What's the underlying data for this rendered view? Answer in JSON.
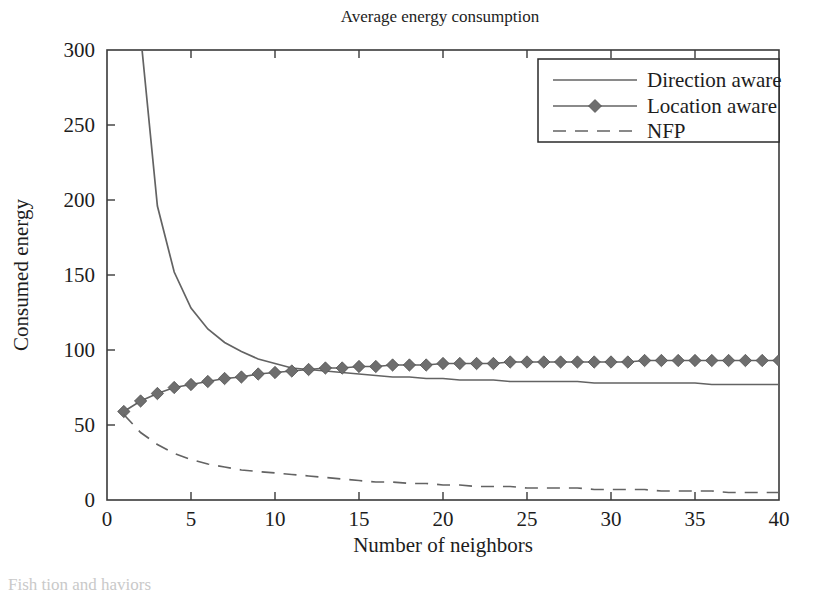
{
  "chart_data": {
    "type": "line",
    "title": "Average energy consumption",
    "xlabel": "Number of neighbors",
    "ylabel": "Consumed energy",
    "xlim": [
      0,
      40
    ],
    "ylim": [
      0,
      300
    ],
    "xticks": [
      0,
      5,
      10,
      15,
      20,
      25,
      30,
      35,
      40
    ],
    "yticks": [
      0,
      50,
      100,
      150,
      200,
      250,
      300
    ],
    "xticklabels": [
      "0",
      "5",
      "10",
      "15",
      "20",
      "25",
      "30",
      "35",
      "40"
    ],
    "yticklabels": [
      "0",
      "50",
      "100",
      "150",
      "200",
      "250",
      "300"
    ],
    "grid": false,
    "legend_position": "upper right",
    "x": [
      1,
      2,
      3,
      4,
      5,
      6,
      7,
      8,
      9,
      10,
      11,
      12,
      13,
      14,
      15,
      16,
      17,
      18,
      19,
      20,
      21,
      22,
      23,
      24,
      25,
      26,
      27,
      28,
      29,
      30,
      31,
      32,
      33,
      34,
      35,
      36,
      37,
      38,
      39,
      40
    ],
    "series": [
      {
        "name": "Direction aware",
        "style": "solid",
        "marker": "none",
        "color": "#636363",
        "values": [
          455,
          310,
          196,
          152,
          128,
          114,
          105,
          99,
          94,
          91,
          88,
          87,
          86,
          85,
          84,
          83,
          82,
          82,
          81,
          81,
          80,
          80,
          80,
          79,
          79,
          79,
          79,
          79,
          78,
          78,
          78,
          78,
          78,
          78,
          78,
          77,
          77,
          77,
          77,
          77
        ]
      },
      {
        "name": "Location aware",
        "style": "solid",
        "marker": "diamond",
        "color": "#6e6e6e",
        "values": [
          59,
          66,
          71,
          75,
          77,
          79,
          81,
          82,
          84,
          85,
          86,
          87,
          88,
          88,
          89,
          89,
          90,
          90,
          90,
          91,
          91,
          91,
          91,
          92,
          92,
          92,
          92,
          92,
          92,
          92,
          92,
          93,
          93,
          93,
          93,
          93,
          93,
          93,
          93,
          93
        ]
      },
      {
        "name": "NFP",
        "style": "dashed",
        "marker": "none",
        "color": "#636363",
        "values": [
          57,
          45,
          37,
          31,
          27,
          24,
          22,
          20,
          19,
          18,
          17,
          16,
          15,
          14,
          13,
          12,
          12,
          11,
          11,
          10,
          10,
          9,
          9,
          9,
          8,
          8,
          8,
          8,
          7,
          7,
          7,
          7,
          6,
          6,
          6,
          6,
          5,
          5,
          5,
          5
        ]
      }
    ]
  },
  "legend": {
    "items": [
      {
        "label": "Direction aware",
        "style": "solid",
        "marker": "none"
      },
      {
        "label": "Location aware",
        "style": "solid",
        "marker": "diamond"
      },
      {
        "label": "NFP",
        "style": "dashed",
        "marker": "none"
      }
    ]
  },
  "caption_fragment": "Fish                        tion and                 haviors"
}
